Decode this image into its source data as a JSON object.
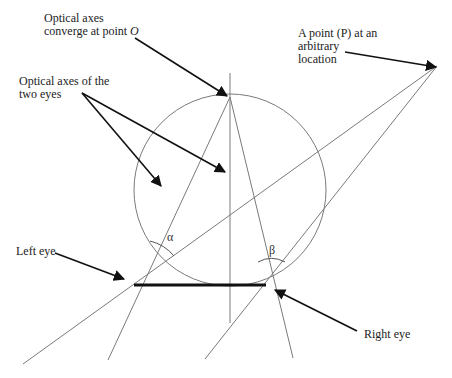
{
  "diagram": {
    "type": "geometric-optics",
    "labels": {
      "converge": {
        "line1": "Optical axes",
        "line2": "converge at point ",
        "point": "O"
      },
      "optical_axes": {
        "line1": "Optical axes of the",
        "line2": "two eyes"
      },
      "point_p": {
        "line1": "A point (P) at an",
        "line2": "arbitrary",
        "line3": "location"
      },
      "left_eye": "Left eye",
      "right_eye": "Right eye",
      "alpha": "α",
      "beta": "β"
    },
    "colors": {
      "line": "#7a7a7a",
      "arrow": "#111111",
      "baseline": "#111111"
    }
  }
}
